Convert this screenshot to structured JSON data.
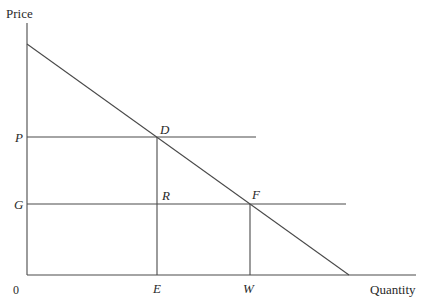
{
  "diagram": {
    "axes": {
      "y_label": "Price",
      "x_label": "Quantity",
      "origin_label": "0"
    },
    "price_levels": [
      {
        "label": "P",
        "y": 137,
        "line_end_x": 256
      },
      {
        "label": "G",
        "y": 204,
        "line_end_x": 346
      }
    ],
    "quantity_levels": [
      {
        "label": "E",
        "x": 157
      },
      {
        "label": "W",
        "x": 250
      }
    ],
    "points": [
      {
        "label": "D",
        "x": 157,
        "y": 137
      },
      {
        "label": "R",
        "x": 157,
        "y": 204
      },
      {
        "label": "F",
        "x": 250,
        "y": 204
      }
    ],
    "demand_line": {
      "x1": 27,
      "y1": 44,
      "x2": 349,
      "y2": 275
    },
    "colors": {
      "line": "#4a4a4a",
      "text": "#2a2a2a",
      "background": "#ffffff"
    }
  }
}
